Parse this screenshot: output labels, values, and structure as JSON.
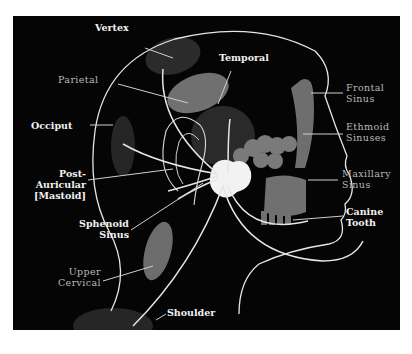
{
  "diagram": {
    "type": "anatomical referred-pain map (head, lateral view)",
    "background": "#050505",
    "colors": {
      "region_fill": "#6e6e6e",
      "region_dark": "#2a2a2a",
      "nerve_lines": "#e6e6e6",
      "ganglion": "#f0f0f0"
    },
    "labels": {
      "vertex": "Vertex",
      "parietal": "Parietal",
      "occiput": "Occiput",
      "post_auricular_1": "Post-",
      "post_auricular_2": "Auricular",
      "post_auricular_3": "[Mastoid]",
      "sphenoid_1": "Sphenoid",
      "sphenoid_2": "Sinus",
      "upper_cervical_1": "Upper",
      "upper_cervical_2": "Cervical",
      "shoulder": "Shoulder",
      "temporal": "Temporal",
      "frontal_1": "Frontal",
      "frontal_2": "Sinus",
      "ethmoid_1": "Ethmoid",
      "ethmoid_2": "Sinuses",
      "maxillary_1": "Maxillary",
      "maxillary_2": "Sinus",
      "canine_1": "Canine",
      "canine_2": "Tooth"
    }
  }
}
